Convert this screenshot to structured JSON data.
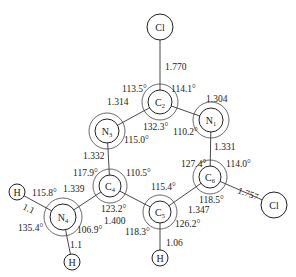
{
  "diagram": {
    "type": "molecular-structure",
    "atoms": [
      {
        "id": "Cl_top",
        "symbol": "Cl",
        "sub": "",
        "x": 160,
        "y": 27,
        "r": 13
      },
      {
        "id": "C2",
        "symbol": "C",
        "sub": "2",
        "x": 160,
        "y": 102,
        "r": 12
      },
      {
        "id": "N1",
        "symbol": "N",
        "sub": "1",
        "x": 211,
        "y": 120,
        "r": 12
      },
      {
        "id": "N3",
        "symbol": "N",
        "sub": "3",
        "x": 107,
        "y": 131,
        "r": 12
      },
      {
        "id": "C4",
        "symbol": "C",
        "sub": "4",
        "x": 110,
        "y": 186,
        "r": 11
      },
      {
        "id": "C6",
        "symbol": "C",
        "sub": "6",
        "x": 210,
        "y": 177,
        "r": 11
      },
      {
        "id": "C5",
        "symbol": "C",
        "sub": "5",
        "x": 160,
        "y": 212,
        "r": 11
      },
      {
        "id": "N4",
        "symbol": "N",
        "sub": "4",
        "x": 63,
        "y": 217,
        "r": 13
      },
      {
        "id": "Cl_right",
        "symbol": "Cl",
        "sub": "",
        "x": 274,
        "y": 205,
        "r": 13
      },
      {
        "id": "H_left",
        "symbol": "H",
        "sub": "",
        "x": 17,
        "y": 192,
        "r": 8
      },
      {
        "id": "H_bottom",
        "symbol": "H",
        "sub": "",
        "x": 72,
        "y": 262,
        "r": 8
      },
      {
        "id": "H_C5",
        "symbol": "H",
        "sub": "",
        "x": 160,
        "y": 258,
        "r": 8
      }
    ],
    "bonds": [
      {
        "from": "Cl_top",
        "to": "C2",
        "length": "1.770",
        "lx": 165,
        "ly": 70
      },
      {
        "from": "C2",
        "to": "N1",
        "length": "1.304",
        "lx": 206,
        "ly": 102
      },
      {
        "from": "C2",
        "to": "N3",
        "length": "1.314",
        "lx": 107,
        "ly": 105
      },
      {
        "from": "N3",
        "to": "C4",
        "length": "1.332",
        "lx": 83,
        "ly": 159
      },
      {
        "from": "N1",
        "to": "C6",
        "length": "1.331",
        "lx": 214,
        "ly": 150
      },
      {
        "from": "C6",
        "to": "Cl_right",
        "length": "1.757",
        "lx": 237,
        "ly": 193,
        "rot": 20
      },
      {
        "from": "C6",
        "to": "C5",
        "length": "1.347",
        "lx": 188,
        "ly": 213
      },
      {
        "from": "C4",
        "to": "C5",
        "length": "1.400",
        "lx": 104,
        "ly": 224
      },
      {
        "from": "C4",
        "to": "N4",
        "length": "1.339",
        "lx": 63,
        "ly": 192
      },
      {
        "from": "N4",
        "to": "H_left",
        "length": "1.1",
        "lx": 22,
        "ly": 209,
        "rot": 25
      },
      {
        "from": "N4",
        "to": "H_bottom",
        "length": "1.1",
        "lx": 70,
        "ly": 248
      },
      {
        "from": "C5",
        "to": "H_C5",
        "length": "1.06",
        "lx": 166,
        "ly": 246
      }
    ],
    "angles": [
      {
        "label": "113.5°",
        "x": 122,
        "y": 92
      },
      {
        "label": "114.1°",
        "x": 171,
        "y": 92
      },
      {
        "label": "132.3°",
        "x": 143,
        "y": 130
      },
      {
        "label": "110.2°",
        "x": 173,
        "y": 135
      },
      {
        "label": "115.0°",
        "x": 124,
        "y": 143
      },
      {
        "label": "127.4°",
        "x": 181,
        "y": 167
      },
      {
        "label": "114.0°",
        "x": 226,
        "y": 167
      },
      {
        "label": "117.9°",
        "x": 73,
        "y": 176
      },
      {
        "label": "110.5°",
        "x": 126,
        "y": 176
      },
      {
        "label": "115.4°",
        "x": 151,
        "y": 190
      },
      {
        "label": "118.5°",
        "x": 199,
        "y": 203
      },
      {
        "label": "115.8°",
        "x": 32,
        "y": 196
      },
      {
        "label": "123.2°",
        "x": 101,
        "y": 212
      },
      {
        "label": "118.3°",
        "x": 125,
        "y": 235
      },
      {
        "label": "126.2°",
        "x": 175,
        "y": 227
      },
      {
        "label": "135.4°",
        "x": 18,
        "y": 231
      },
      {
        "label": "106.9°",
        "x": 77,
        "y": 233
      }
    ]
  }
}
